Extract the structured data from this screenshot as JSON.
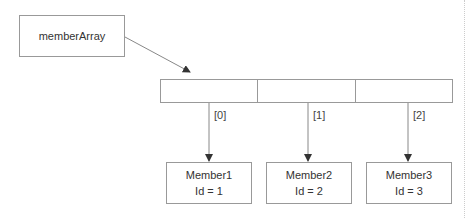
{
  "diagram": {
    "pointer": {
      "label": "memberArray"
    },
    "array": {
      "cells": 3,
      "indices": [
        "[0]",
        "[1]",
        "[2]"
      ]
    },
    "members": [
      {
        "name": "Member1",
        "id": "Id = 1"
      },
      {
        "name": "Member2",
        "id": "Id = 2"
      },
      {
        "name": "Member3",
        "id": "Id = 3"
      }
    ],
    "colors": {
      "stroke": "#999999",
      "arrow": "#555555",
      "text": "#333333"
    }
  }
}
